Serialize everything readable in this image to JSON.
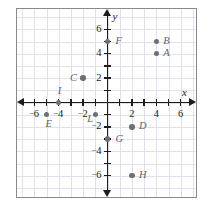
{
  "figure": {
    "axis_labels": {
      "x": "x",
      "y": "y"
    },
    "border_color": "#8a8a8a",
    "grid_color": "#dfe2ea",
    "axis_color": "#1c1c1c",
    "point_color": "#6e6e78",
    "label_color": "#5f5f68"
  },
  "chart_data": {
    "type": "scatter",
    "title": "",
    "xlabel": "x",
    "ylabel": "y",
    "xlim": [
      -7,
      7
    ],
    "ylim": [
      -7,
      7
    ],
    "grid": true,
    "legend": "none",
    "x_ticks": [
      -6,
      -4,
      -2,
      2,
      4,
      6
    ],
    "y_ticks": [
      -6,
      -4,
      -2,
      2,
      4,
      6
    ],
    "x_tick_labels": [
      "⁻6",
      "⁻4",
      "⁻2",
      "2",
      "4",
      "6"
    ],
    "y_tick_labels": [
      "⁻6",
      "⁻4",
      "⁻2",
      "2",
      "4",
      "6"
    ],
    "points": [
      {
        "label": "A",
        "x": 4,
        "y": 4,
        "label_dx": 7,
        "label_dy": 0
      },
      {
        "label": "B",
        "x": 4,
        "y": 5,
        "label_dx": 7,
        "label_dy": 0
      },
      {
        "label": "C",
        "x": -2,
        "y": 2,
        "label_dx": -13,
        "label_dy": 0
      },
      {
        "label": "D",
        "x": 2,
        "y": -2,
        "label_dx": 7,
        "label_dy": 0
      },
      {
        "label": "E",
        "x": -5,
        "y": -1,
        "label_dx": -1,
        "label_dy": 10
      },
      {
        "label": "F",
        "x": 0,
        "y": 5,
        "label_dx": 8,
        "label_dy": 0
      },
      {
        "label": "G",
        "x": 0,
        "y": -3,
        "label_dx": 8,
        "label_dy": 0
      },
      {
        "label": "H",
        "x": 2,
        "y": -6,
        "label_dx": 7,
        "label_dy": 0
      },
      {
        "label": "I",
        "x": -4,
        "y": 0,
        "label_dx": -1,
        "label_dy": -11
      },
      {
        "label": "L",
        "x": -1,
        "y": -1,
        "label_dx": -8,
        "label_dy": 5
      }
    ]
  }
}
